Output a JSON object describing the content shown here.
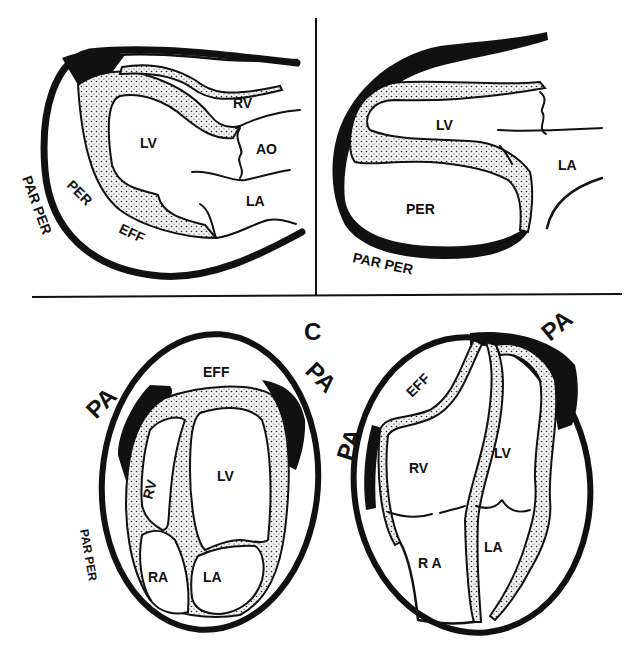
{
  "figure": {
    "panel_c_label": "C",
    "panel_top_left": {
      "labels": {
        "rv": "RV",
        "lv": "LV",
        "ao": "AO",
        "la": "LA",
        "per": "PER",
        "eff": "EFF",
        "par_per": "PAR PER"
      }
    },
    "panel_top_right": {
      "labels": {
        "lv": "LV",
        "la": "LA",
        "per": "PER",
        "par_per": "PAR PER"
      }
    },
    "panel_bottom_left": {
      "labels": {
        "eff": "EFF",
        "pa_left": "PA",
        "pa_right": "PA",
        "rv": "RV",
        "lv": "LV",
        "ra": "RA",
        "la": "LA",
        "par_per": "PAR PER"
      }
    },
    "panel_bottom_right": {
      "labels": {
        "eff": "EFF",
        "pa_left": "PA",
        "pa_right": "PA",
        "rv": "RV",
        "lv": "LV",
        "ra": "R A",
        "la": "LA"
      }
    },
    "colors": {
      "ink": "#111111",
      "background": "#ffffff"
    }
  }
}
